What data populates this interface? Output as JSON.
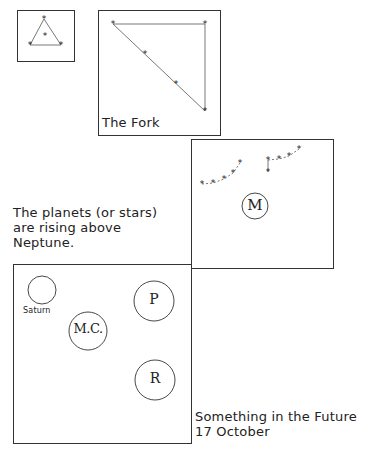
{
  "panels": {
    "triangle": {
      "name": "small-triangle-constellation"
    },
    "fork": {
      "caption": "The Fork"
    },
    "m_panel": {
      "planet": "M"
    },
    "caption_middle": {
      "lines": [
        "The planets (or stars)",
        "are rising above",
        "Neptune."
      ]
    },
    "lower": {
      "saturn_label": "Saturn",
      "planets": [
        "M.C.",
        "P",
        "R"
      ]
    },
    "caption_bottom": {
      "lines": [
        "Something in the Future",
        "17 October"
      ]
    }
  },
  "colors": {
    "ink": "#222222",
    "line": "#555555",
    "background": "#ffffff"
  }
}
